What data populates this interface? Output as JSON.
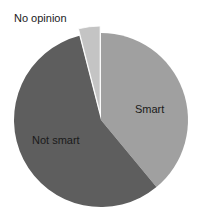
{
  "chart_data": {
    "type": "pie",
    "title": "",
    "categories": [
      "Smart",
      "Not smart",
      "No opinion"
    ],
    "values": [
      39,
      57,
      4
    ],
    "colors": [
      "#a0a0a0",
      "#5e5e5e",
      "#c4c4c4"
    ],
    "exploded": [
      "No opinion"
    ],
    "start_angle_deg": 0,
    "direction": "clockwise",
    "legend": "none",
    "labels": {
      "smart": "Smart",
      "not_smart": "Not smart",
      "no_opinion": "No opinion"
    }
  }
}
